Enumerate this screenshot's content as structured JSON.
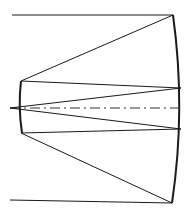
{
  "diagram": {
    "type": "optical-ray-diagram",
    "colors": {
      "line": "#1a1a1a",
      "background": "#ffffff"
    },
    "elements": {
      "primary_mirror": {
        "label": "",
        "shape": "concave-arc"
      },
      "secondary_mirror": {
        "label": "",
        "shape": "concave-arc"
      },
      "optical_axis": {
        "label": "",
        "style": "dash-dot"
      },
      "rays": [
        {
          "name": "top-incoming-ray"
        },
        {
          "name": "top-reflected-ray"
        },
        {
          "name": "top-secondary-ray"
        },
        {
          "name": "bottom-incoming-ray"
        },
        {
          "name": "bottom-reflected-ray"
        },
        {
          "name": "bottom-secondary-ray"
        }
      ]
    }
  }
}
